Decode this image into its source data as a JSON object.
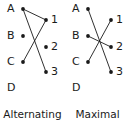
{
  "figure": {
    "background_color": "#ffffff",
    "ink_color": "#1a1a1a",
    "panels": [
      {
        "id": "alternating-path",
        "caption_lines": [
          "Alternating",
          "path"
        ],
        "left_vertices": [
          {
            "id": "A",
            "label": "A",
            "x": 23,
            "y": 9,
            "has_dot": true
          },
          {
            "id": "B",
            "label": "B",
            "x": 23,
            "y": 36,
            "has_dot": true
          },
          {
            "id": "C",
            "label": "C",
            "x": 23,
            "y": 62,
            "has_dot": true
          },
          {
            "id": "D",
            "label": "D",
            "x": 23,
            "y": 88,
            "has_dot": false
          }
        ],
        "right_vertices": [
          {
            "id": "1",
            "label": "1",
            "x": 46,
            "y": 20,
            "has_dot": true
          },
          {
            "id": "2",
            "label": "2",
            "x": 46,
            "y": 47,
            "has_dot": true
          },
          {
            "id": "3",
            "label": "3",
            "x": 46,
            "y": 72,
            "has_dot": true
          }
        ],
        "edges": [
          {
            "from": "A",
            "to": "1"
          },
          {
            "from": "A",
            "to": "3"
          },
          {
            "from": "C",
            "to": "1"
          }
        ],
        "isolated_vertices": [
          "B",
          "D",
          "2"
        ]
      },
      {
        "id": "maximal-matching",
        "caption_lines": [
          "Maximal",
          "matching"
        ],
        "left_vertices": [
          {
            "id": "A",
            "label": "A",
            "x": 23,
            "y": 9,
            "has_dot": true
          },
          {
            "id": "B",
            "label": "B",
            "x": 23,
            "y": 36,
            "has_dot": true
          },
          {
            "id": "C",
            "label": "C",
            "x": 23,
            "y": 62,
            "has_dot": true
          },
          {
            "id": "D",
            "label": "D",
            "x": 23,
            "y": 88,
            "has_dot": false
          }
        ],
        "right_vertices": [
          {
            "id": "1",
            "label": "1",
            "x": 46,
            "y": 20,
            "has_dot": true
          },
          {
            "id": "2",
            "label": "2",
            "x": 46,
            "y": 47,
            "has_dot": true
          },
          {
            "id": "3",
            "label": "3",
            "x": 46,
            "y": 72,
            "has_dot": true
          }
        ],
        "edges": [
          {
            "from": "A",
            "to": "3"
          },
          {
            "from": "B",
            "to": "2"
          },
          {
            "from": "C",
            "to": "1"
          }
        ],
        "isolated_vertices": [
          "D"
        ]
      }
    ]
  }
}
